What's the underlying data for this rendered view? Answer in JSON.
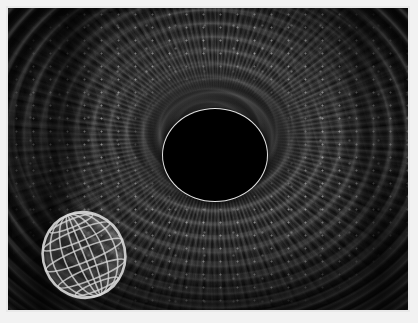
{
  "figure": {
    "caption": "",
    "palette": {
      "background": "#ffffff",
      "frame": "#e9e9e9",
      "disc_dark": "#101010",
      "disc_mid": "#3c3c3c",
      "filament_light": "#ffffff",
      "shadow_disc": "#000000",
      "shadow_rim": "#e4e4e4",
      "globe_line": "#d9d9d9"
    },
    "canvas": {
      "width": 400,
      "height": 302
    }
  },
  "elements": {
    "vortex_label": "swirling filament vortex",
    "dark_lane_label": "dark radial dust lane",
    "rings_label": "concentric arc bands",
    "streaks_label": "radial streak filaments",
    "speckle_label": "bright knot speckle",
    "shadow_label": "central black shadow disc",
    "shadow_rim_label": "bright photon rim",
    "globe_label": "wireframe globe overlay"
  },
  "globe": {
    "name": "wireframe-globe",
    "center_x": 46,
    "center_y": 48,
    "radius_x": 41,
    "radius_y": 43,
    "tilt_deg": -22,
    "meridian_count": 5,
    "parallel_count": 4,
    "line_color": "#d9d9d9"
  },
  "shadow_disc": {
    "center_x": 207,
    "center_y": 147,
    "radius_x": 52,
    "radius_y": 46,
    "fill": "#000000",
    "rim": "#e4e4e4"
  }
}
